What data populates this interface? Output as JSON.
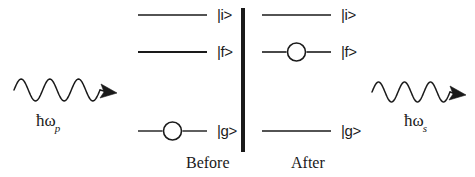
{
  "figure": {
    "kind": "energy-level-diagram",
    "process": "Raman (Stokes) scattering",
    "background_color": "#ffffff",
    "ink_color": "#1a1a1a",
    "width": 475,
    "height": 177
  },
  "divider": {
    "name": "panel-divider",
    "x": 243,
    "y_top": 8,
    "y_bottom": 152,
    "thickness": 4,
    "color": "#1a1a1a"
  },
  "panels": [
    {
      "id": "before",
      "caption": "Before",
      "caption_x": 186,
      "caption_y": 155,
      "line_x_start": 138,
      "line_x_end": 207,
      "label_x": 217,
      "levels": [
        {
          "id": "i",
          "label": "|i>",
          "y": 15,
          "occupied": false,
          "line_width": 1.4
        },
        {
          "id": "f",
          "label": "|f>",
          "y": 52,
          "occupied": false,
          "line_width": 2.2
        },
        {
          "id": "g",
          "label": "|g>",
          "y": 131,
          "occupied": true,
          "line_width": 1.4
        }
      ]
    },
    {
      "id": "after",
      "caption": "After",
      "caption_x": 291,
      "caption_y": 155,
      "line_x_start": 262,
      "line_x_end": 331,
      "label_x": 341,
      "levels": [
        {
          "id": "i",
          "label": "|i>",
          "y": 15,
          "occupied": false,
          "line_width": 1.4
        },
        {
          "id": "f",
          "label": "|f>",
          "y": 52,
          "occupied": true,
          "line_width": 1.6
        },
        {
          "id": "g",
          "label": "|g>",
          "y": 131,
          "occupied": false,
          "line_width": 1.4
        }
      ]
    }
  ],
  "electron_marker": {
    "name": "electron-circle",
    "radius": 9,
    "stroke_width": 1.6,
    "fill": "none",
    "stroke": "#1a1a1a"
  },
  "photons": [
    {
      "id": "pump",
      "name": "incident-pump-photon",
      "label_hbar": "ħ",
      "label_omega": "ω",
      "label_subscript": "p",
      "label_text": "ħωp",
      "label_x": 36,
      "label_y": 112,
      "wave": {
        "x_start": 14,
        "x_end": 100,
        "y_center": 90,
        "amplitude": 11,
        "cycles": 3,
        "direction": "right",
        "arrow_tip_x": 117,
        "arrow_tip_y": 93
      }
    },
    {
      "id": "stokes",
      "name": "scattered-stokes-photon",
      "label_hbar": "ħ",
      "label_omega": "ω",
      "label_subscript": "s",
      "label_text": "ħωs",
      "label_x": 404,
      "label_y": 112,
      "wave": {
        "x_start": 372,
        "x_end": 450,
        "y_center": 92,
        "amplitude": 10,
        "cycles": 3,
        "direction": "right",
        "arrow_tip_x": 466,
        "arrow_tip_y": 95
      }
    }
  ]
}
